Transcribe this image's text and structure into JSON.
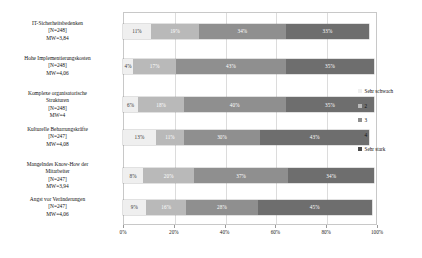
{
  "chart_data": {
    "type": "bar",
    "subtype": "stacked-horizontal-100-percent",
    "title": "",
    "xlabel": "",
    "ylabel": "",
    "xlim": [
      0,
      100
    ],
    "grid": true,
    "legend_position": "right",
    "xticks": [
      "0%",
      "20%",
      "40%",
      "60%",
      "80%",
      "100%"
    ],
    "xtick_values": [
      0,
      20,
      40,
      60,
      80,
      100
    ],
    "legend": [
      "Sehr schwach",
      "2",
      "3",
      "4",
      "Sehr stark"
    ],
    "series": [
      {
        "name": "Sehr schwach",
        "color": "#efefef",
        "values": [
          11,
          4,
          6,
          13,
          8,
          9
        ]
      },
      {
        "name": "2",
        "color": "#b9b9b9",
        "values": [
          19,
          17,
          18,
          11,
          20,
          16
        ]
      },
      {
        "name": "3",
        "color": "#8f8f8f",
        "values": [
          34,
          43,
          40,
          30,
          37,
          28
        ]
      },
      {
        "name": "4",
        "color": "#6e6e6e",
        "values": [
          33,
          35,
          35,
          43,
          34,
          45
        ]
      },
      {
        "name": "Sehr stark",
        "color": "#4a4a4a",
        "values": [
          3,
          1,
          1,
          3,
          1,
          2
        ]
      }
    ],
    "categories": [
      {
        "name": "IT-Sicherheitsbedenken",
        "n": "[N=248]",
        "mw": "MW=3,84",
        "segments": [
          {
            "label": "11%",
            "value": 11,
            "class": "s1"
          },
          {
            "label": "19%",
            "value": 19,
            "class": "s2"
          },
          {
            "label": "34%",
            "value": 34,
            "class": "s3"
          },
          {
            "label": "33%",
            "value": 33,
            "class": "s4"
          }
        ]
      },
      {
        "name": "Hohe Implementierungskosten",
        "n": "[N=248]",
        "mw": "MW=4,06",
        "segments": [
          {
            "label": "4%",
            "value": 4,
            "class": "s1"
          },
          {
            "label": "17%",
            "value": 17,
            "class": "s2"
          },
          {
            "label": "43%",
            "value": 43,
            "class": "s3"
          },
          {
            "label": "35%",
            "value": 35,
            "class": "s4"
          }
        ]
      },
      {
        "name": "Komplexe organisatorische",
        "name2": "Strukturen",
        "n": "[N=248]",
        "mw": "MW=4",
        "segments": [
          {
            "label": "6%",
            "value": 6,
            "class": "s1"
          },
          {
            "label": "18%",
            "value": 18,
            "class": "s2"
          },
          {
            "label": "40%",
            "value": 40,
            "class": "s3"
          },
          {
            "label": "35%",
            "value": 35,
            "class": "s4"
          }
        ]
      },
      {
        "name": "Kulturelle Beharrungskräfte",
        "n": "[N=247]",
        "mw": "MW=4,08",
        "segments": [
          {
            "label": "13%",
            "value": 13,
            "class": "s1"
          },
          {
            "label": "11%",
            "value": 11,
            "class": "s2"
          },
          {
            "label": "30%",
            "value": 30,
            "class": "s3"
          },
          {
            "label": "43%",
            "value": 43,
            "class": "s4"
          }
        ]
      },
      {
        "name": "Mangelndes Know-How der",
        "name2": "Mitarbeiter",
        "n": "[N=247]",
        "mw": "MW=3,94",
        "segments": [
          {
            "label": "8%",
            "value": 8,
            "class": "s1"
          },
          {
            "label": "20%",
            "value": 20,
            "class": "s2"
          },
          {
            "label": "37%",
            "value": 37,
            "class": "s3"
          },
          {
            "label": "34%",
            "value": 34,
            "class": "s4"
          }
        ]
      },
      {
        "name": "Angst vor Veränderungen",
        "n": "[N=247]",
        "mw": "MW=4,06",
        "segments": [
          {
            "label": "9%",
            "value": 9,
            "class": "s1"
          },
          {
            "label": "16%",
            "value": 16,
            "class": "s2"
          },
          {
            "label": "28%",
            "value": 28,
            "class": "s3"
          },
          {
            "label": "45%",
            "value": 45,
            "class": "s4"
          }
        ]
      }
    ]
  }
}
